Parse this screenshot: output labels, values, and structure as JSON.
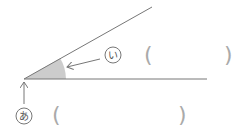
{
  "diagram": {
    "type": "angle-worksheet",
    "colors": {
      "line": "#777777",
      "shade": "#cccccc",
      "paren": "#aaaaaa",
      "label": "#555555"
    },
    "labels": {
      "vertex": "あ",
      "angle": "い"
    },
    "answer_boxes": {
      "vertex": {
        "open": "(",
        "close": ")",
        "value": ""
      },
      "angle": {
        "open": "(",
        "close": ")",
        "value": ""
      }
    }
  }
}
